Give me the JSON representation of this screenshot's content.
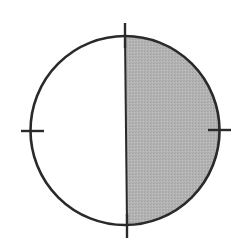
{
  "diagram": {
    "circle": {
      "cx": 125,
      "cy": 130.5,
      "r": 94.5
    },
    "divider": {
      "x1": 125,
      "y1": 36,
      "x2": 127,
      "y2": 225
    },
    "shaded_half": "right",
    "colors": {
      "stroke": "#2a2a2a",
      "shade": "#b3b3b3",
      "background": "#ffffff"
    },
    "ticks": [
      {
        "name": "top",
        "x1": 125,
        "y1": 23,
        "x2": 125,
        "y2": 48
      },
      {
        "name": "bottom",
        "x1": 127,
        "y1": 214,
        "x2": 127,
        "y2": 238
      },
      {
        "name": "left",
        "x1": 21,
        "y1": 131,
        "x2": 44,
        "y2": 131
      },
      {
        "name": "right",
        "x1": 208,
        "y1": 130,
        "x2": 231,
        "y2": 130
      }
    ]
  }
}
